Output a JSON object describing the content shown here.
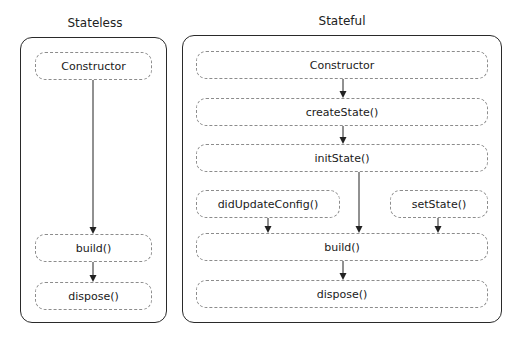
{
  "stateless": {
    "title": "Stateless",
    "boxes": {
      "constructor": "Constructor",
      "build": "build()",
      "dispose": "dispose()"
    }
  },
  "stateful": {
    "title": "Stateful",
    "boxes": {
      "constructor": "Constructor",
      "createState": "createState()",
      "initState": "initState()",
      "didUpdateConfig": "didUpdateConfig()",
      "setState": "setState()",
      "build": "build()",
      "dispose": "dispose()"
    }
  },
  "colors": {
    "panel_border": "#2a2a2a",
    "box_border": "#8c8c8c",
    "arrow": "#222222"
  }
}
